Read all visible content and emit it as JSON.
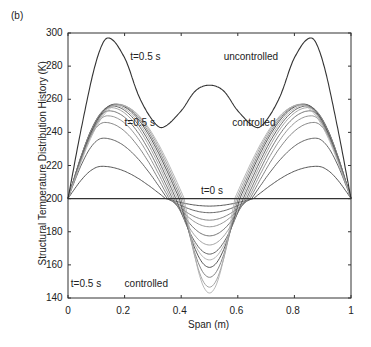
{
  "panel_label": "(b)",
  "chart_data": {
    "type": "line",
    "title": "",
    "xlabel": "Span (m)",
    "ylabel": "Structural Temperature Distribution History (K)",
    "xlim": [
      0,
      1
    ],
    "ylim": [
      140,
      300
    ],
    "xticks": [
      "0",
      "0.2",
      "0.4",
      "0.6",
      "0.8",
      "1"
    ],
    "yticks": [
      "140",
      "160",
      "180",
      "200",
      "220",
      "240",
      "260",
      "280",
      "300"
    ],
    "grid": false,
    "annotations": [
      {
        "text": "t=0.5 s",
        "x": 0.22,
        "y": 285
      },
      {
        "text": "uncontrolled",
        "x": 0.55,
        "y": 285
      },
      {
        "text": "t=0.5 s",
        "x": 0.2,
        "y": 245
      },
      {
        "text": "controlled",
        "x": 0.58,
        "y": 245
      },
      {
        "text": "t=0 s",
        "x": 0.47,
        "y": 204
      },
      {
        "text": "t=0.5 s",
        "x": 0.01,
        "y": 148
      },
      {
        "text": "controlled",
        "x": 0.2,
        "y": 148
      }
    ],
    "series": [
      {
        "name": "uncontrolled t=0.5 s",
        "color": "#333333",
        "x": [
          0,
          0.05,
          0.1,
          0.14,
          0.2,
          0.25,
          0.3,
          0.335,
          0.4,
          0.45,
          0.5,
          0.55,
          0.6,
          0.665,
          0.7,
          0.75,
          0.8,
          0.86,
          0.9,
          0.95,
          1
        ],
        "y": [
          200,
          245,
          283,
          297,
          285,
          262,
          247,
          243,
          253,
          265,
          268.5,
          265,
          253,
          243,
          247,
          262,
          285,
          297,
          283,
          245,
          200
        ]
      },
      {
        "name": "controlled t=0 s",
        "color": "#333333",
        "x": [
          0,
          1
        ],
        "y": [
          200,
          200
        ]
      }
    ],
    "controlled_peak_values": [
      219.5,
      236.5,
      246,
      250,
      253,
      255,
      256,
      256.5,
      257,
      257,
      257,
      256.5
    ],
    "controlled_peak_positions": [
      0.12,
      0.125,
      0.13,
      0.14,
      0.145,
      0.15,
      0.155,
      0.16,
      0.165,
      0.17,
      0.175,
      0.18
    ],
    "controlled_dip_values": [
      195.5,
      191.5,
      187,
      183,
      177.5,
      172,
      166.5,
      163,
      158.5,
      152.5,
      146.5,
      143
    ],
    "controlled_colors": [
      "#444444",
      "#555555",
      "#777777",
      "#8a8a8a",
      "#666666",
      "#999999",
      "#555555",
      "#aaaaaa",
      "#444444",
      "#777777",
      "#999999",
      "#b0b0b0"
    ]
  }
}
